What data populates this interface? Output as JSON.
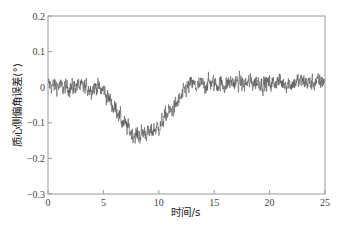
{
  "chart_data": {
    "type": "line",
    "title": "",
    "xlabel": "时间/s",
    "ylabel": "质心侧偏角误差(°)",
    "xlim": [
      0,
      25
    ],
    "ylim": [
      -0.3,
      0.2
    ],
    "x_ticks": [
      0,
      5,
      10,
      15,
      20,
      25
    ],
    "x_tick_labels": [
      "0",
      "5",
      "10",
      "15",
      "20",
      "25"
    ],
    "y_ticks": [
      0.2,
      0.1,
      0,
      -0.1,
      -0.2,
      -0.3
    ],
    "y_tick_labels": [
      "0.2",
      "0.1",
      "0",
      "−0.1",
      "−0.2",
      "−0.3"
    ],
    "grid": false,
    "legend": null,
    "series": [
      {
        "name": "质心侧偏角误差",
        "color": "#555555",
        "description": "Noisy error signal (amplitude ~±0.05) around 0, dipping to about −0.13 mean (spikes to −0.2) between t≈5 s and t≈12.5 s, minimum near t≈8 s, then returning to ~0.01 with noise until 25 s",
        "mean_curve": {
          "t": [
            0,
            2,
            4,
            5,
            5.5,
            6,
            7,
            8,
            9,
            10,
            11,
            12,
            12.5,
            13,
            15,
            18,
            21,
            25
          ],
          "y": [
            0.005,
            0.0,
            0.0,
            -0.01,
            -0.03,
            -0.06,
            -0.11,
            -0.135,
            -0.13,
            -0.11,
            -0.07,
            -0.03,
            -0.005,
            0.005,
            0.01,
            0.012,
            0.012,
            0.015
          ]
        },
        "noise_amplitude": 0.035,
        "num_points": 1250
      }
    ]
  },
  "axes": {
    "x_label": "时间/s",
    "y_label": "质心侧偏角误差(°)"
  }
}
